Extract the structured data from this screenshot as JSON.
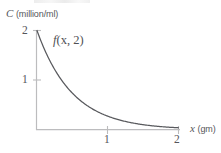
{
  "figure": {
    "title": "",
    "background_color": "#ffffff",
    "axis_color": "#b9b9bb",
    "curve_color": "#58595d",
    "text_color": "#55565a"
  },
  "chart_data": {
    "type": "line",
    "title": "",
    "subtitle": "",
    "xlabel": "x (gm)",
    "xlabel_variable": "x",
    "xlabel_unit": "(gm)",
    "ylabel": "C (million/ml)",
    "ylabel_variable": "C",
    "ylabel_unit": "(million/ml)",
    "xlim": [
      0,
      2.05
    ],
    "ylim": [
      0,
      2.1
    ],
    "xticks": [
      1,
      2
    ],
    "xtick_labels": [
      "1",
      "2"
    ],
    "yticks": [
      1,
      2
    ],
    "ytick_labels": [
      "1",
      "2"
    ],
    "grid": false,
    "legend": "none",
    "annotations": [
      {
        "name": "curve-label",
        "text": "f(x, 2)",
        "text_function": "f",
        "text_args": "(x, 2)",
        "x": 0.32,
        "y": 1.75
      }
    ],
    "series": [
      {
        "name": "f(x, 2)",
        "expression": "2*exp(-2x)",
        "color": "#58595d",
        "x": [
          0.0,
          0.1,
          0.2,
          0.3,
          0.4,
          0.5,
          0.6,
          0.7,
          0.8,
          0.9,
          1.0,
          1.1,
          1.2,
          1.3,
          1.4,
          1.5,
          1.6,
          1.7,
          1.8,
          1.9,
          2.0
        ],
        "y": [
          2.0,
          1.64,
          1.34,
          1.1,
          0.9,
          0.74,
          0.6,
          0.49,
          0.4,
          0.33,
          0.27,
          0.22,
          0.18,
          0.15,
          0.12,
          0.1,
          0.08,
          0.07,
          0.05,
          0.04,
          0.04
        ]
      }
    ]
  },
  "labels": {
    "y_axis": {
      "variable": "C",
      "unit": "(million/ml)"
    },
    "x_axis": {
      "variable": "x",
      "unit": "(gm)"
    },
    "y_tick_2": "2",
    "y_tick_1": "1",
    "x_tick_1": "1",
    "x_tick_2": "2",
    "curve": {
      "function": "f",
      "args": "(x, 2)"
    }
  }
}
